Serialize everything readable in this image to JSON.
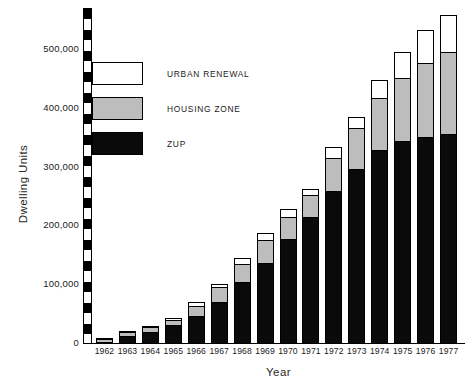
{
  "chart_data": {
    "type": "bar",
    "stacked": true,
    "title": "",
    "subtitle": "",
    "xlabel": "Year",
    "ylabel": "Dwelling Units",
    "ylim": [
      0,
      570000
    ],
    "yticks": [
      0,
      100000,
      200000,
      300000,
      400000,
      500000
    ],
    "ytick_labels": [
      "0",
      "100,000",
      "200,000",
      "300,000",
      "400,000",
      "500,000"
    ],
    "grid": false,
    "legend_position": "upper-left-inside",
    "categories": [
      "1962",
      "1963",
      "1964",
      "1965",
      "1966",
      "1967",
      "1968",
      "1969",
      "1970",
      "1971",
      "1972",
      "1973",
      "1974",
      "1975",
      "1976",
      "1977"
    ],
    "series": [
      {
        "name": "ZUP",
        "color": "#0a0a0a",
        "values": [
          4000,
          14000,
          21000,
          33000,
          48000,
          72000,
          106000,
          137000,
          178000,
          216000,
          261000,
          298000,
          330000,
          345000,
          352000,
          358000
        ]
      },
      {
        "name": "HOUSING ZONE",
        "color": "#bdbdbd",
        "values": [
          6000,
          8000,
          9000,
          10000,
          19000,
          26000,
          31000,
          41000,
          40000,
          39000,
          57000,
          72000,
          90000,
          110000,
          128000,
          141000
        ]
      },
      {
        "name": "URBAN RENEWAL",
        "color": "#ffffff",
        "values": [
          1000,
          3000,
          3000,
          4000,
          8000,
          7000,
          13000,
          15000,
          15000,
          13000,
          20000,
          20000,
          32000,
          45000,
          57000,
          64000
        ]
      }
    ],
    "totals": [
      11000,
      25000,
      33000,
      47000,
      75000,
      105000,
      150000,
      193000,
      233000,
      268000,
      338000,
      390000,
      452000,
      500000,
      537000,
      563000
    ]
  },
  "legend": {
    "items": [
      {
        "label": "URBAN RENEWAL",
        "swatch": "urban"
      },
      {
        "label": "HOUSING ZONE",
        "swatch": "housing"
      },
      {
        "label": "ZUP",
        "swatch": "zup"
      }
    ]
  },
  "axes": {
    "y_title": "Dwelling Units",
    "x_title": "Year"
  }
}
